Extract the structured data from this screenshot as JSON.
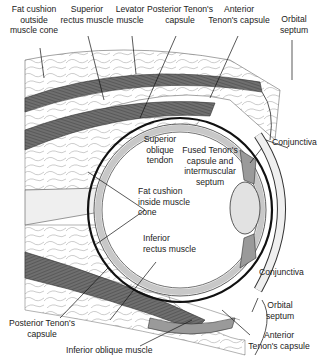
{
  "diagram": {
    "labels": {
      "fat_outside": [
        "Fat cushion",
        "outside",
        "muscle cone"
      ],
      "superior_rectus": [
        "Superior",
        "rectus muscle"
      ],
      "levator": [
        "Levator",
        "muscle"
      ],
      "posterior_tenon_top": [
        "Posterior Tenon's",
        "capsule"
      ],
      "anterior_tenon_top": [
        "Anterior",
        "Tenon's capsule"
      ],
      "orbital_septum_top": [
        "Orbital",
        "septum"
      ],
      "conjunctiva_top": "Conjunctiva",
      "superior_oblique": [
        "Superior",
        "oblique",
        "tendon"
      ],
      "fused_tenon": [
        "Fused Tenon's",
        "capsule and",
        "intermuscular",
        "septum"
      ],
      "fat_inside": [
        "Fat cushion",
        "inside muscle",
        "cone"
      ],
      "inferior_rectus": [
        "Inferior",
        "rectus muscle"
      ],
      "conjunctiva_bottom": "Conjunctiva",
      "orbital_septum_bottom": [
        "Orbital",
        "septum"
      ],
      "posterior_tenon_bottom": [
        "Posterior Tenon's",
        "capsule"
      ],
      "anterior_tenon_bottom": [
        "Anterior",
        "Tenon's capsule"
      ],
      "inferior_oblique": "Inferior oblique muscle"
    },
    "colors": {
      "muscle": "#6f6f6f",
      "muscle_light": "#9a9a9a",
      "fat": "#f2f2f2",
      "sclera_band": "#c8c8c8",
      "outline": "#222222",
      "text": "#222222"
    }
  }
}
